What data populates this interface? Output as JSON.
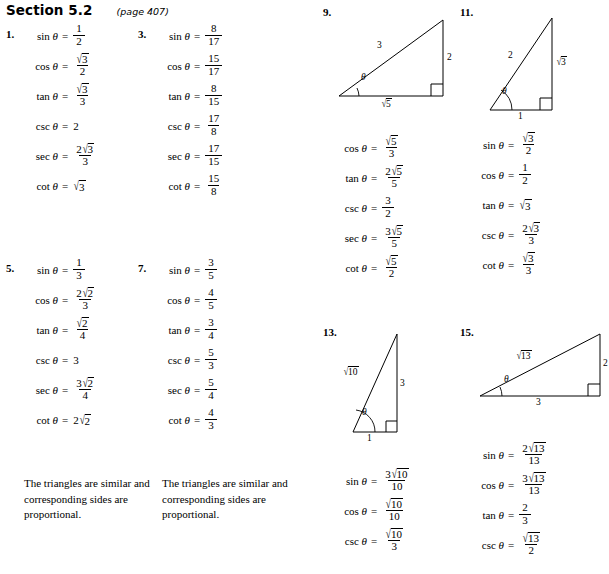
{
  "header": {
    "section": "Section 5.2",
    "page_ref": "(page 407)"
  },
  "symbols": {
    "theta": "θ",
    "equals": "=",
    "sqrt": "√",
    "sin": "sin",
    "cos": "cos",
    "tan": "tan",
    "csc": "csc",
    "sec": "sec",
    "cot": "cot"
  },
  "problems": {
    "p1": {
      "number": "1.",
      "rows": [
        {
          "fn": "sin",
          "num": "1",
          "den": "2"
        },
        {
          "fn": "cos",
          "num_radical": "3",
          "num_coef": "",
          "den": "2"
        },
        {
          "fn": "tan",
          "num_radical": "3",
          "num_coef": "",
          "den": "3"
        },
        {
          "fn": "csc",
          "whole": "2"
        },
        {
          "fn": "sec",
          "num_radical": "3",
          "num_coef": "2",
          "den": "3"
        },
        {
          "fn": "cot",
          "whole_radical": "3"
        }
      ]
    },
    "p3": {
      "number": "3.",
      "rows": [
        {
          "fn": "sin",
          "num": "8",
          "den": "17"
        },
        {
          "fn": "cos",
          "num": "15",
          "den": "17"
        },
        {
          "fn": "tan",
          "num": "8",
          "den": "15"
        },
        {
          "fn": "csc",
          "num": "17",
          "den": "8"
        },
        {
          "fn": "sec",
          "num": "17",
          "den": "15"
        },
        {
          "fn": "cot",
          "num": "15",
          "den": "8"
        }
      ]
    },
    "p5": {
      "number": "5.",
      "rows": [
        {
          "fn": "sin",
          "num": "1",
          "den": "3"
        },
        {
          "fn": "cos",
          "num_radical": "2",
          "num_coef": "2",
          "den": "3"
        },
        {
          "fn": "tan",
          "num_radical": "2",
          "num_coef": "",
          "den": "4"
        },
        {
          "fn": "csc",
          "whole": "3"
        },
        {
          "fn": "sec",
          "num_radical": "2",
          "num_coef": "3",
          "den": "4"
        },
        {
          "fn": "cot",
          "whole_radical": "2",
          "whole_coef": "2"
        }
      ],
      "note": "The triangles are similar and corresponding sides are proportional."
    },
    "p7": {
      "number": "7.",
      "rows": [
        {
          "fn": "sin",
          "num": "3",
          "den": "5"
        },
        {
          "fn": "cos",
          "num": "4",
          "den": "5"
        },
        {
          "fn": "tan",
          "num": "3",
          "den": "4"
        },
        {
          "fn": "csc",
          "num": "5",
          "den": "3"
        },
        {
          "fn": "sec",
          "num": "5",
          "den": "4"
        },
        {
          "fn": "cot",
          "num": "4",
          "den": "3"
        }
      ],
      "note": "The triangles are similar and corresponding sides are proportional."
    },
    "p9": {
      "number": "9.",
      "triangle": {
        "hypotenuse_label": "3",
        "vertical_label": "2",
        "base_radical": "5",
        "angle_label": "θ",
        "orientation": "apex-top-right"
      },
      "rows": [
        {
          "fn": "cos",
          "num_radical": "5",
          "num_coef": "",
          "den": "3"
        },
        {
          "fn": "tan",
          "num_radical": "5",
          "num_coef": "2",
          "den": "5"
        },
        {
          "fn": "csc",
          "num": "3",
          "den": "2"
        },
        {
          "fn": "sec",
          "num_radical": "5",
          "num_coef": "3",
          "den": "5"
        },
        {
          "fn": "cot",
          "num_radical": "5",
          "num_coef": "",
          "den": "2"
        }
      ]
    },
    "p11": {
      "number": "11.",
      "triangle": {
        "hypotenuse_label": "2",
        "vertical_radical": "3",
        "base_label": "1",
        "angle_label": "θ",
        "orientation": "apex-top-right-tall"
      },
      "rows": [
        {
          "fn": "sin",
          "num_radical": "3",
          "num_coef": "",
          "den": "2"
        },
        {
          "fn": "cos",
          "num": "1",
          "den": "2"
        },
        {
          "fn": "tan",
          "whole_radical": "3"
        },
        {
          "fn": "csc",
          "num_radical": "3",
          "num_coef": "2",
          "den": "3"
        },
        {
          "fn": "cot",
          "num_radical": "3",
          "num_coef": "",
          "den": "3"
        }
      ]
    },
    "p13": {
      "number": "13.",
      "triangle": {
        "hypotenuse_radical": "10",
        "vertical_label": "3",
        "base_label": "1",
        "angle_label": "θ",
        "orientation": "narrow-tall"
      },
      "rows": [
        {
          "fn": "sin",
          "num_radical": "10",
          "num_coef": "3",
          "den": "10"
        },
        {
          "fn": "cos",
          "num_radical": "10",
          "num_coef": "",
          "den": "10"
        },
        {
          "fn": "csc",
          "num_radical": "10",
          "num_coef": "",
          "den": "3"
        }
      ]
    },
    "p15": {
      "number": "15.",
      "triangle": {
        "hypotenuse_radical": "13",
        "vertical_label": "2",
        "base_label": "3",
        "angle_label": "θ",
        "orientation": "wide-flat"
      },
      "rows": [
        {
          "fn": "sin",
          "num_radical": "13",
          "num_coef": "2",
          "den": "13"
        },
        {
          "fn": "cos",
          "num_radical": "13",
          "num_coef": "3",
          "den": "13"
        },
        {
          "fn": "tan",
          "num": "2",
          "den": "3"
        },
        {
          "fn": "csc",
          "num_radical": "13",
          "num_coef": "",
          "den": "2"
        }
      ]
    }
  }
}
